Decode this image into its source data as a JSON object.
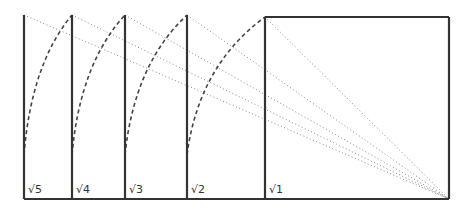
{
  "diagram": {
    "type": "root-rectangles-construction",
    "baseline_y": 199,
    "top_y": 15,
    "square_top_y": 17,
    "focal_point": [
      449,
      199
    ],
    "rectangles": [
      {
        "label": "√5",
        "x0": 24,
        "x1": 72
      },
      {
        "label": "√4",
        "x0": 72,
        "x1": 125
      },
      {
        "label": "√3",
        "x0": 125,
        "x1": 187
      },
      {
        "label": "√2",
        "x0": 187,
        "x1": 265
      },
      {
        "label": "√1",
        "x0": 265,
        "x1": 449
      }
    ],
    "colors": {
      "solid_line": "#333333",
      "dashed_arc": "#444444",
      "dotted_line": "#888888"
    }
  }
}
